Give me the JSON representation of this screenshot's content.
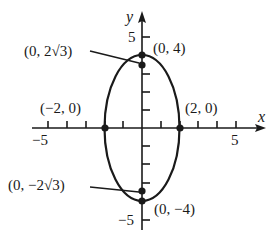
{
  "figure": {
    "type": "ellipse-graph",
    "equation_implied": "x^2/4 + y^2/16 = 1",
    "axes": {
      "x_label": "x",
      "y_label": "y",
      "x_tick_labels": {
        "neg": "−5",
        "pos": "5"
      },
      "y_tick_labels": {
        "pos": "5",
        "neg": "−5"
      },
      "x_range": [
        -5.5,
        6.5
      ],
      "y_range": [
        -5.5,
        6.2
      ]
    },
    "points": [
      {
        "id": "top-vertex",
        "label": "(0, 4)",
        "x": 0,
        "y": 4
      },
      {
        "id": "bottom-vertex",
        "label": "(0, −4)",
        "x": 0,
        "y": -4
      },
      {
        "id": "left-covertex",
        "label": "(−2, 0)",
        "x": -2,
        "y": 0
      },
      {
        "id": "right-covertex",
        "label": "(2, 0)",
        "x": 2,
        "y": 0
      },
      {
        "id": "upper-focus",
        "label": "(0, 2√3)",
        "x": 0,
        "y": 3.464
      },
      {
        "id": "lower-focus",
        "label": "(0, −2√3)",
        "x": 0,
        "y": -3.464
      }
    ],
    "colors": {
      "ink": "#1a1a1a",
      "background": "#ffffff"
    }
  }
}
